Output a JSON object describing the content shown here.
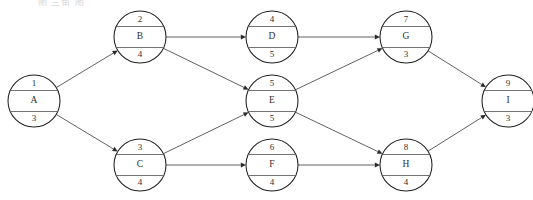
{
  "diagram": {
    "type": "activity-on-node-network",
    "caption_fragment": "图 三角 图",
    "node_radius": 26,
    "columns_x": [
      34,
      140,
      272,
      406,
      508
    ],
    "rows_y": [
      37,
      101,
      165
    ],
    "colors": {
      "node_fill": "#ffffff",
      "node_stroke": "#1f1f1f",
      "divider_stroke": "#5a5a5a",
      "edge_stroke": "#4f4f4f",
      "arrow_fill": "#2b2b2b",
      "text": "#2f2f2f",
      "background": "#ffffff"
    },
    "nodes": [
      {
        "key": "A",
        "id": "1",
        "label": "A",
        "duration": "3",
        "cx": 34,
        "cy": 101
      },
      {
        "key": "B",
        "id": "2",
        "label": "B",
        "duration": "4",
        "cx": 140,
        "cy": 37
      },
      {
        "key": "C",
        "id": "3",
        "label": "C",
        "duration": "4",
        "cx": 140,
        "cy": 165
      },
      {
        "key": "D",
        "id": "4",
        "label": "D",
        "duration": "5",
        "cx": 272,
        "cy": 37
      },
      {
        "key": "E",
        "id": "5",
        "label": "E",
        "duration": "5",
        "cx": 272,
        "cy": 101
      },
      {
        "key": "F",
        "id": "6",
        "label": "F",
        "duration": "4",
        "cx": 272,
        "cy": 165
      },
      {
        "key": "G",
        "id": "7",
        "label": "G",
        "duration": "3",
        "cx": 406,
        "cy": 37
      },
      {
        "key": "H",
        "id": "8",
        "label": "H",
        "duration": "4",
        "cx": 406,
        "cy": 165
      },
      {
        "key": "I",
        "id": "9",
        "label": "I",
        "duration": "3",
        "cx": 508,
        "cy": 101
      }
    ],
    "edges": [
      {
        "from": "A",
        "to": "B"
      },
      {
        "from": "A",
        "to": "C"
      },
      {
        "from": "B",
        "to": "D"
      },
      {
        "from": "B",
        "to": "E"
      },
      {
        "from": "C",
        "to": "E"
      },
      {
        "from": "C",
        "to": "F"
      },
      {
        "from": "D",
        "to": "G"
      },
      {
        "from": "E",
        "to": "G"
      },
      {
        "from": "E",
        "to": "H"
      },
      {
        "from": "F",
        "to": "H"
      },
      {
        "from": "G",
        "to": "I"
      },
      {
        "from": "H",
        "to": "I"
      }
    ]
  }
}
